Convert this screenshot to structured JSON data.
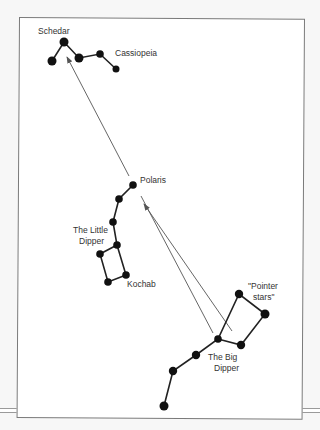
{
  "labels": {
    "schedar": "Schedar",
    "cassiopeia": "Cassiopeia",
    "polaris": "Polaris",
    "little_dipper_1": "The Little",
    "little_dipper_2": "Dipper",
    "kochab": "Kochab",
    "pointer_1": "\"Pointer",
    "pointer_2": "stars\"",
    "big_dipper_1": "The Big",
    "big_dipper_2": "Dipper"
  },
  "colors": {
    "star": "#111111",
    "line": "#222222",
    "arrow": "#555555",
    "text": "#333333"
  },
  "constellations": {
    "cassiopeia": [
      [
        52,
        61
      ],
      [
        64,
        42
      ],
      [
        79,
        58
      ],
      [
        100,
        54
      ],
      [
        116,
        69
      ]
    ],
    "little_dipper": [
      [
        133,
        185
      ],
      [
        119,
        199
      ],
      [
        113,
        222
      ],
      [
        117,
        245
      ],
      [
        100,
        254
      ],
      [
        108,
        282
      ],
      [
        126,
        275
      ],
      [
        117,
        245
      ]
    ],
    "big_dipper": [
      [
        164,
        406
      ],
      [
        173,
        371
      ],
      [
        196,
        355
      ],
      [
        218,
        339
      ],
      [
        239,
        294
      ],
      [
        265,
        314
      ],
      [
        241,
        345
      ],
      [
        218,
        339
      ]
    ]
  },
  "arrows": [
    {
      "from": [
        129,
        176
      ],
      "to": [
        67,
        57
      ]
    },
    {
      "from": [
        232,
        331
      ],
      "to": [
        144,
        204
      ]
    },
    {
      "from": [
        213,
        333
      ],
      "to": [
        141,
        196
      ]
    }
  ]
}
